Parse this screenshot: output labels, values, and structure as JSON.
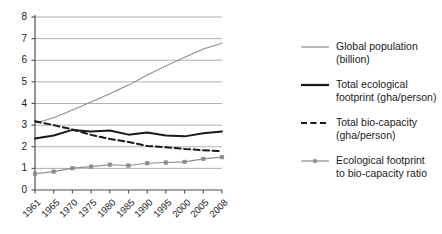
{
  "chart_data": {
    "type": "line",
    "title": "",
    "xlabel": "",
    "ylabel": "",
    "xlim": [
      1961,
      2008
    ],
    "ylim": [
      0,
      8
    ],
    "grid": true,
    "legend_position": "right",
    "categories": [
      "1961",
      "1965",
      "1970",
      "1975",
      "1980",
      "1985",
      "1990",
      "1995",
      "2000",
      "2005",
      "2008"
    ],
    "x": [
      1961,
      1965,
      1970,
      1975,
      1980,
      1985,
      1990,
      1995,
      2000,
      2005,
      2008
    ],
    "yticks": [
      "0",
      "1",
      "2",
      "3",
      "4",
      "5",
      "6",
      "7",
      "8"
    ],
    "series": [
      {
        "name": "Global population (billion)",
        "style": "solid-light",
        "color": "#8c8c8c",
        "markers": false,
        "values": [
          3.09,
          3.34,
          3.7,
          4.07,
          4.45,
          4.85,
          5.32,
          5.74,
          6.14,
          6.52,
          6.79
        ]
      },
      {
        "name": "Total ecological footprint (gha/person)",
        "style": "solid-bold",
        "color": "#1a1a1a",
        "markers": false,
        "values": [
          2.38,
          2.52,
          2.78,
          2.71,
          2.75,
          2.56,
          2.66,
          2.52,
          2.48,
          2.62,
          2.7
        ]
      },
      {
        "name": "Total bio-capacity (gha/person)",
        "style": "dashed",
        "color": "#1a1a1a",
        "markers": false,
        "values": [
          3.18,
          3.0,
          2.8,
          2.55,
          2.36,
          2.22,
          2.04,
          1.98,
          1.9,
          1.84,
          1.79
        ]
      },
      {
        "name": "Ecological footprint to bio-capacity ratio",
        "style": "solid-marker",
        "color": "#8c8c8c",
        "markers": true,
        "values": [
          0.75,
          0.85,
          1.01,
          1.08,
          1.17,
          1.13,
          1.24,
          1.27,
          1.3,
          1.44,
          1.52
        ]
      }
    ]
  },
  "legend": {
    "entries": [
      {
        "label": "Global population (billion)",
        "line1": "Global population",
        "line2": "(billion)"
      },
      {
        "label": "Total ecological footprint (gha/person)",
        "line1": "Total ecological",
        "line2": "footprint (gha/person)"
      },
      {
        "label": "Total bio-capacity (gha/person)",
        "line1": "Total bio-capacity",
        "line2": "(gha/person)"
      },
      {
        "label": "Ecological footprint to bio-capacity ratio",
        "line1": "Ecological footprint",
        "line2": "to bio-capacity ratio"
      }
    ]
  },
  "colors": {
    "light_line": "#8c8c8c",
    "dark_line": "#1a1a1a",
    "gridline": "#a8a8a8",
    "axis": "#4d4d4d",
    "text": "#1a1a1a",
    "background": "#ffffff"
  }
}
